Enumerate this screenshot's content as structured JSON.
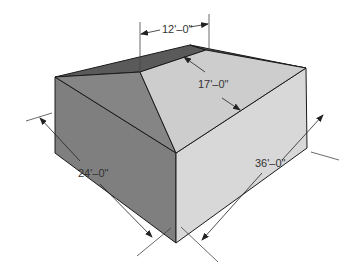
{
  "diagram": {
    "dimensions": {
      "ridge_length": "12'–0\"",
      "roof_slope_width": "17'–0\"",
      "building_width": "24'–0\"",
      "building_length": "36'–0\""
    },
    "colors": {
      "hip_end_face": "#7a7a7a",
      "dark_side_face": "#808080",
      "main_roof_plane": "#cfcfcf",
      "light_side_face": "#d6d6d6",
      "back_roof_plane": "#555555",
      "outline": "#1a1a1a",
      "dimension_line": "#444444"
    }
  }
}
